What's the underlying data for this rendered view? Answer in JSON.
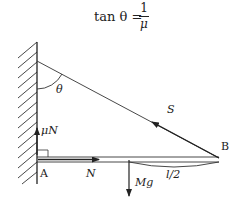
{
  "equation": {
    "lhs": "tan θ =",
    "numerator": "1",
    "denominator": "μ"
  },
  "diagram": {
    "labels": {
      "theta": "θ",
      "mu_n": "μN",
      "point_a": "A",
      "normal": "N",
      "tension": "S",
      "half_length": "l/2",
      "point_b": "B",
      "weight": "Mg"
    },
    "colors": {
      "ink": "#222222",
      "background": "#ffffff"
    }
  }
}
